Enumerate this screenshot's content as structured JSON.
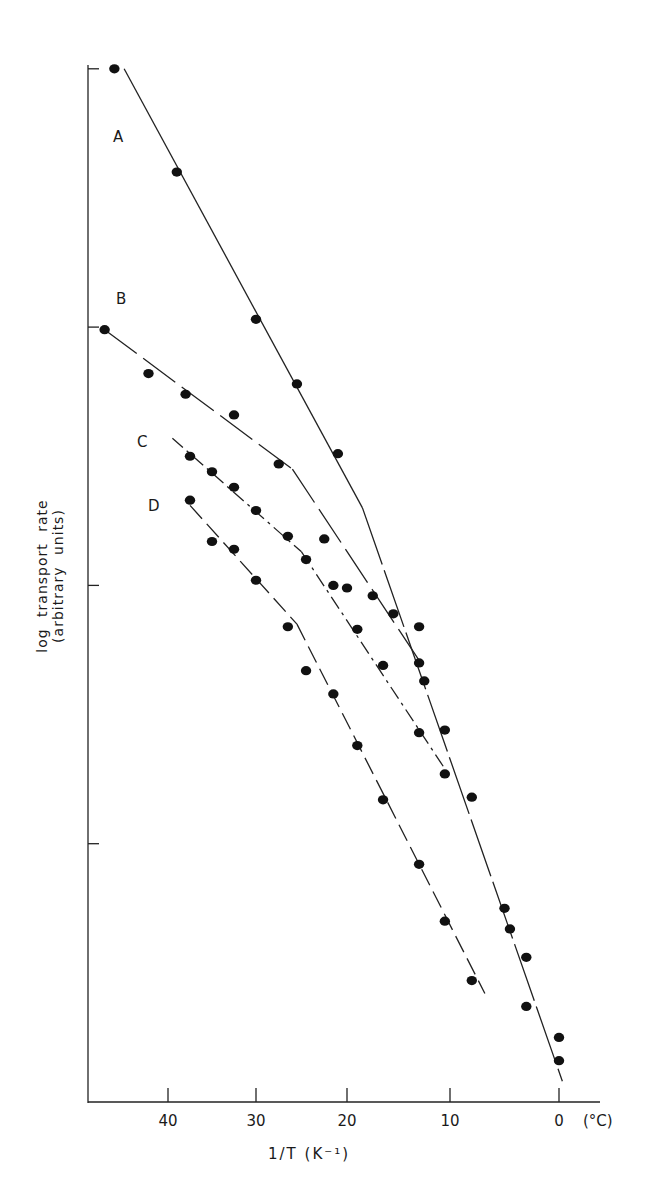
{
  "chart_data": {
    "type": "scatter",
    "title": "",
    "xlabel": "1/T (K⁻¹)",
    "x_unit_label": "(°C)",
    "ylabel": "log transport rate (arbitrary units)",
    "x_tick_labels": [
      "40",
      "30",
      "20",
      "10",
      "0"
    ],
    "x_ticks_celsius": [
      40,
      30,
      20,
      10,
      0
    ],
    "y_ticks": [
      1,
      2,
      3,
      4
    ],
    "y_tick_labels": [
      "",
      "",
      "",
      ""
    ],
    "xlim_celsius": [
      48,
      -4
    ],
    "ylim": [
      0,
      4.3
    ],
    "grid": false,
    "legend": "inline labels A, B, C, D",
    "series": [
      {
        "name": "A",
        "line_style": "solid with break near 18°C",
        "points": [
          [
            45.5,
            4.0
          ],
          [
            39.0,
            3.6
          ],
          [
            30.0,
            3.03
          ],
          [
            25.5,
            2.78
          ],
          [
            21.0,
            2.51
          ],
          [
            15.5,
            1.89
          ],
          [
            13.0,
            1.7
          ],
          [
            10.5,
            1.44
          ],
          [
            8.0,
            1.18
          ],
          [
            5.0,
            0.75
          ],
          [
            4.5,
            0.67
          ],
          [
            3.0,
            0.56
          ],
          [
            3.0,
            0.37
          ],
          [
            0.0,
            0.16
          ],
          [
            0.0,
            0.25
          ]
        ],
        "fit_segments": [
          [
            [
              44.5,
              4.0
            ],
            [
              18.5,
              2.3
            ]
          ],
          [
            [
              18.5,
              2.3
            ],
            [
              -0.3,
              0.08
            ]
          ]
        ]
      },
      {
        "name": "B",
        "line_style": "long dash",
        "points": [
          [
            46.5,
            2.99
          ],
          [
            42.0,
            2.82
          ],
          [
            38.0,
            2.74
          ],
          [
            32.5,
            2.66
          ],
          [
            27.5,
            2.47
          ],
          [
            22.5,
            2.18
          ],
          [
            20.0,
            1.99
          ],
          [
            17.5,
            1.96
          ],
          [
            13.0,
            1.84
          ],
          [
            12.5,
            1.63
          ]
        ],
        "fit_segments": [
          [
            [
              46.5,
              2.99
            ],
            [
              26.0,
              2.45
            ]
          ],
          [
            [
              26.0,
              2.45
            ],
            [
              12.5,
              1.68
            ]
          ]
        ]
      },
      {
        "name": "C",
        "line_style": "dash-dot",
        "points": [
          [
            37.5,
            2.5
          ],
          [
            35.0,
            2.44
          ],
          [
            32.5,
            2.38
          ],
          [
            30.0,
            2.29
          ],
          [
            26.5,
            2.19
          ],
          [
            24.5,
            2.1
          ],
          [
            21.5,
            2.0
          ],
          [
            19.0,
            1.83
          ],
          [
            16.5,
            1.69
          ],
          [
            13.0,
            1.43
          ],
          [
            10.5,
            1.27
          ]
        ],
        "fit_segments": [
          [
            [
              39.5,
              2.57
            ],
            [
              25.0,
              2.13
            ]
          ],
          [
            [
              25.0,
              2.13
            ],
            [
              10.5,
              1.29
            ]
          ]
        ]
      },
      {
        "name": "D",
        "line_style": "dashed",
        "points": [
          [
            37.5,
            2.33
          ],
          [
            35.0,
            2.17
          ],
          [
            32.5,
            2.14
          ],
          [
            30.0,
            2.02
          ],
          [
            26.5,
            1.84
          ],
          [
            24.5,
            1.67
          ],
          [
            21.5,
            1.58
          ],
          [
            19.0,
            1.38
          ],
          [
            16.5,
            1.17
          ],
          [
            13.0,
            0.92
          ],
          [
            10.5,
            0.7
          ],
          [
            8.0,
            0.47
          ]
        ],
        "fit_segments": [
          [
            [
              37.5,
              2.31
            ],
            [
              25.5,
              1.85
            ]
          ],
          [
            [
              25.5,
              1.85
            ],
            [
              6.8,
              0.42
            ]
          ]
        ]
      }
    ]
  },
  "labels": {
    "ylabel": "log transport rate (arbitrary units)",
    "xlabel": "1/T (K⁻¹)",
    "x_unit": "(°C)",
    "series_A": "A",
    "series_B": "B",
    "series_C": "C",
    "series_D": "D",
    "tick_40": "40",
    "tick_30": "30",
    "tick_20": "20",
    "tick_10": "10",
    "tick_0": "0"
  }
}
